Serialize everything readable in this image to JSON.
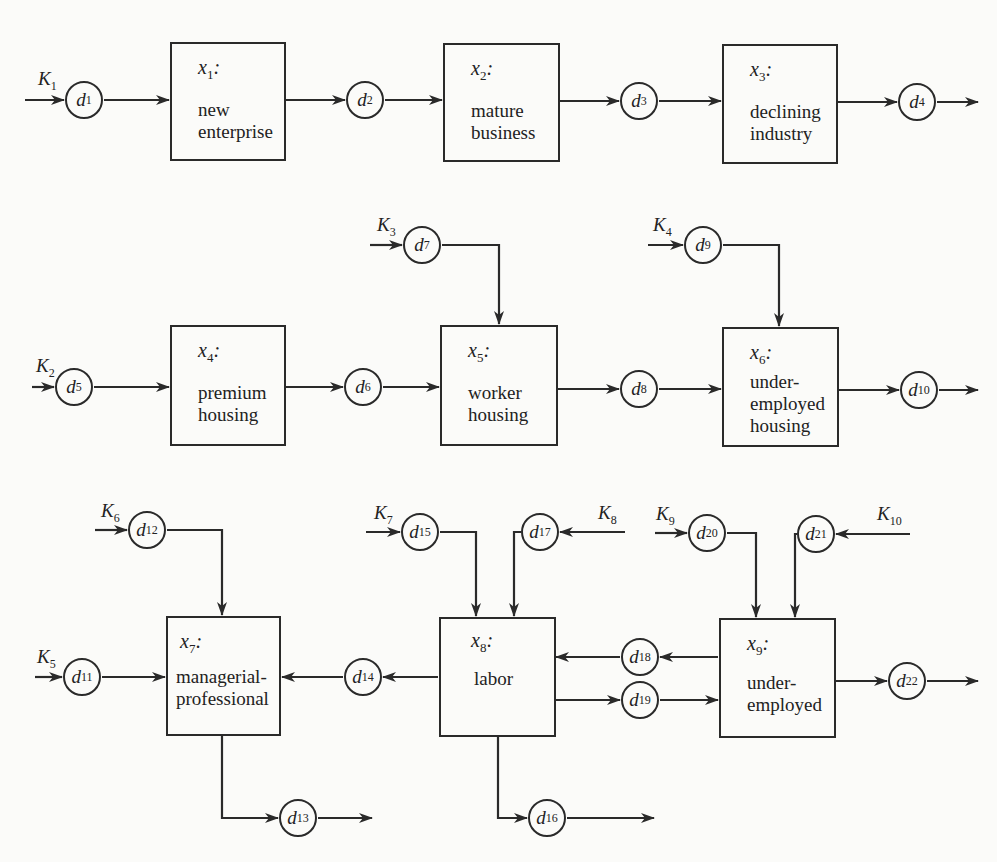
{
  "diagram": {
    "type": "flow-network",
    "stock_boxes": [
      {
        "id": "x1",
        "var": "x",
        "sub": "1",
        "label": "new\nenterprise"
      },
      {
        "id": "x2",
        "var": "x",
        "sub": "2",
        "label": "mature\nbusiness"
      },
      {
        "id": "x3",
        "var": "x",
        "sub": "3",
        "label": "declining\nindustry"
      },
      {
        "id": "x4",
        "var": "x",
        "sub": "4",
        "label": "premium\nhousing"
      },
      {
        "id": "x5",
        "var": "x",
        "sub": "5",
        "label": "worker\nhousing"
      },
      {
        "id": "x6",
        "var": "x",
        "sub": "6",
        "label": "under-\nemployed\nhousing"
      },
      {
        "id": "x7",
        "var": "x",
        "sub": "7",
        "label": "managerial-\nprofessional"
      },
      {
        "id": "x8",
        "var": "x",
        "sub": "8",
        "label": "labor"
      },
      {
        "id": "x9",
        "var": "x",
        "sub": "9",
        "label": "under-\nemployed"
      }
    ],
    "flow_nodes": [
      {
        "id": "d1",
        "var": "d",
        "sub": "1"
      },
      {
        "id": "d2",
        "var": "d",
        "sub": "2"
      },
      {
        "id": "d3",
        "var": "d",
        "sub": "3"
      },
      {
        "id": "d4",
        "var": "d",
        "sub": "4"
      },
      {
        "id": "d5",
        "var": "d",
        "sub": "5"
      },
      {
        "id": "d6",
        "var": "d",
        "sub": "6"
      },
      {
        "id": "d7",
        "var": "d",
        "sub": "7"
      },
      {
        "id": "d8",
        "var": "d",
        "sub": "8"
      },
      {
        "id": "d9",
        "var": "d",
        "sub": "9"
      },
      {
        "id": "d10",
        "var": "d",
        "sub": "10"
      },
      {
        "id": "d11",
        "var": "d",
        "sub": "11"
      },
      {
        "id": "d12",
        "var": "d",
        "sub": "12"
      },
      {
        "id": "d13",
        "var": "d",
        "sub": "13"
      },
      {
        "id": "d14",
        "var": "d",
        "sub": "14"
      },
      {
        "id": "d15",
        "var": "d",
        "sub": "15"
      },
      {
        "id": "d16",
        "var": "d",
        "sub": "16"
      },
      {
        "id": "d17",
        "var": "d",
        "sub": "17"
      },
      {
        "id": "d18",
        "var": "d",
        "sub": "18"
      },
      {
        "id": "d19",
        "var": "d",
        "sub": "19"
      },
      {
        "id": "d20",
        "var": "d",
        "sub": "20"
      },
      {
        "id": "d21",
        "var": "d",
        "sub": "21"
      },
      {
        "id": "d22",
        "var": "d",
        "sub": "22"
      }
    ],
    "inputs": [
      {
        "id": "K1",
        "var": "K",
        "sub": "1"
      },
      {
        "id": "K2",
        "var": "K",
        "sub": "2"
      },
      {
        "id": "K3",
        "var": "K",
        "sub": "3"
      },
      {
        "id": "K4",
        "var": "K",
        "sub": "4"
      },
      {
        "id": "K5",
        "var": "K",
        "sub": "5"
      },
      {
        "id": "K6",
        "var": "K",
        "sub": "6"
      },
      {
        "id": "K7",
        "var": "K",
        "sub": "7"
      },
      {
        "id": "K8",
        "var": "K",
        "sub": "8"
      },
      {
        "id": "K9",
        "var": "K",
        "sub": "9"
      },
      {
        "id": "K10",
        "var": "K",
        "sub": "10"
      }
    ],
    "edges": [
      [
        "K1",
        "d1"
      ],
      [
        "d1",
        "x1"
      ],
      [
        "x1",
        "d2"
      ],
      [
        "d2",
        "x2"
      ],
      [
        "x2",
        "d3"
      ],
      [
        "d3",
        "x3"
      ],
      [
        "x3",
        "d4"
      ],
      [
        "d4",
        "out"
      ],
      [
        "K2",
        "d5"
      ],
      [
        "d5",
        "x4"
      ],
      [
        "x4",
        "d6"
      ],
      [
        "d6",
        "x5"
      ],
      [
        "K3",
        "d7"
      ],
      [
        "d7",
        "x5"
      ],
      [
        "x5",
        "d8"
      ],
      [
        "d8",
        "x6"
      ],
      [
        "K4",
        "d9"
      ],
      [
        "d9",
        "x6"
      ],
      [
        "x6",
        "d10"
      ],
      [
        "d10",
        "out"
      ],
      [
        "K5",
        "d11"
      ],
      [
        "d11",
        "x7"
      ],
      [
        "K6",
        "d12"
      ],
      [
        "d12",
        "x7"
      ],
      [
        "x7",
        "d13"
      ],
      [
        "d13",
        "out"
      ],
      [
        "x8",
        "d14"
      ],
      [
        "d14",
        "x7"
      ],
      [
        "K7",
        "d15"
      ],
      [
        "d15",
        "x8"
      ],
      [
        "K8",
        "d17"
      ],
      [
        "d17",
        "x8"
      ],
      [
        "x8",
        "d16"
      ],
      [
        "d16",
        "out"
      ],
      [
        "x9",
        "d18"
      ],
      [
        "d18",
        "x8"
      ],
      [
        "x8",
        "d19"
      ],
      [
        "d19",
        "x9"
      ],
      [
        "K9",
        "d20"
      ],
      [
        "d20",
        "x9"
      ],
      [
        "K10",
        "d21"
      ],
      [
        "d21",
        "x9"
      ],
      [
        "x9",
        "d22"
      ],
      [
        "d22",
        "out"
      ]
    ]
  }
}
